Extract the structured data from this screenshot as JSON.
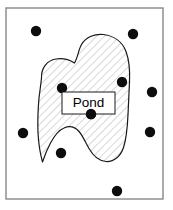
{
  "figure": {
    "background_color": "#ffffff",
    "frame": {
      "name": "study-area-frame",
      "x": 6,
      "y": 8,
      "width": 157,
      "height": 191,
      "stroke_color": "#888888",
      "stroke_width": 1.4,
      "fill_color": "#ffffff"
    },
    "pond": {
      "name": "pond-region",
      "outline_color": "#1a1a1a",
      "outline_width": 1.2,
      "fill_color": "#ffffff",
      "hatch_color": "#b9b9b9",
      "hatch_angle_deg": 45,
      "hatch_spacing": 5.5,
      "path": "M 41.5 78 C 41 68 47 60.5 56 59 C 64 57.8 70.5 60.5 74.5 63 C 78 57 78.5 49.5 81.5 44.5 C 86 37 95 33.5 103.5 34.5 C 114 35.8 122.5 42 126 51.5 C 129.5 61 130 72 129.5 82 C 129 93 128.5 104 128 114.5 C 127.5 126 127 137 123.5 147.5 C 120.5 156.5 114 162 106 161.5 C 98.5 161 93 155.5 89 148.5 C 85.5 142.5 83 136 79 131.5 C 75 127 69.5 125.5 64 128 C 58 130.5 54 136.5 50.5 143 C 47 149.5 44.5 156 42.5 162 C 40 153 38.5 143 38 132.5 C 37.5 121 38 109.5 39 98 C 39.8 91.5 40.8 84.8 41.5 78 Z"
    },
    "label_box": {
      "name": "pond-label-box",
      "text": "Pond",
      "x": 62,
      "y": 92,
      "width": 53,
      "height": 22,
      "fill_color": "#ffffff",
      "stroke_color": "#1a1a1a",
      "stroke_width": 1,
      "text_color": "#000000"
    },
    "sample_points": {
      "name": "sample-points",
      "radius": 5.2,
      "color": "#0d0d0d",
      "outside_label": "outside-pond",
      "inside_label": "inside-pond",
      "points": [
        {
          "id": "p1",
          "x": 36,
          "y": 31,
          "location": "outside-pond"
        },
        {
          "id": "p2",
          "x": 133,
          "y": 34,
          "location": "outside-pond"
        },
        {
          "id": "p3",
          "x": 152,
          "y": 92,
          "location": "outside-pond"
        },
        {
          "id": "p4",
          "x": 150,
          "y": 132,
          "location": "outside-pond"
        },
        {
          "id": "p5",
          "x": 23,
          "y": 133,
          "location": "outside-pond"
        },
        {
          "id": "p6",
          "x": 117,
          "y": 191,
          "location": "outside-pond"
        },
        {
          "id": "p7",
          "x": 62,
          "y": 88,
          "location": "inside-pond"
        },
        {
          "id": "p8",
          "x": 122,
          "y": 82,
          "location": "inside-pond"
        },
        {
          "id": "p9",
          "x": 91,
          "y": 114,
          "location": "inside-pond"
        },
        {
          "id": "p10",
          "x": 61,
          "y": 153,
          "location": "inside-pond"
        }
      ]
    }
  }
}
